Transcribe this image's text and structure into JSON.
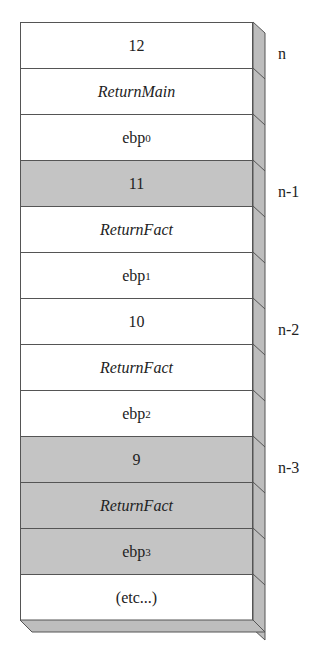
{
  "diagram": {
    "rows": [
      {
        "text": "12",
        "italic": false,
        "sub": "",
        "shaded": false
      },
      {
        "text": "ReturnMain",
        "italic": true,
        "sub": "",
        "shaded": false
      },
      {
        "text": "ebp",
        "italic": false,
        "sub": "0",
        "shaded": false
      },
      {
        "text": "11",
        "italic": false,
        "sub": "",
        "shaded": true
      },
      {
        "text": "ReturnFact",
        "italic": true,
        "sub": "",
        "shaded": false
      },
      {
        "text": "ebp",
        "italic": false,
        "sub": "1",
        "shaded": false
      },
      {
        "text": "10",
        "italic": false,
        "sub": "",
        "shaded": false
      },
      {
        "text": "ReturnFact",
        "italic": true,
        "sub": "",
        "shaded": false
      },
      {
        "text": "ebp",
        "italic": false,
        "sub": "2",
        "shaded": false
      },
      {
        "text": "9",
        "italic": false,
        "sub": "",
        "shaded": true
      },
      {
        "text": "ReturnFact",
        "italic": true,
        "sub": "",
        "shaded": true
      },
      {
        "text": "ebp",
        "italic": false,
        "sub": "3",
        "shaded": true
      },
      {
        "text": "(etc...)",
        "italic": false,
        "sub": "",
        "shaded": false
      }
    ],
    "side_labels": [
      {
        "text": "n",
        "row": 0
      },
      {
        "text": "n-1",
        "row": 3
      },
      {
        "text": "n-2",
        "row": 6
      },
      {
        "text": "n-3",
        "row": 9
      }
    ],
    "colors": {
      "shaded": "#c4c4c4",
      "face": "#bdbdbd",
      "border": "#555555"
    }
  }
}
